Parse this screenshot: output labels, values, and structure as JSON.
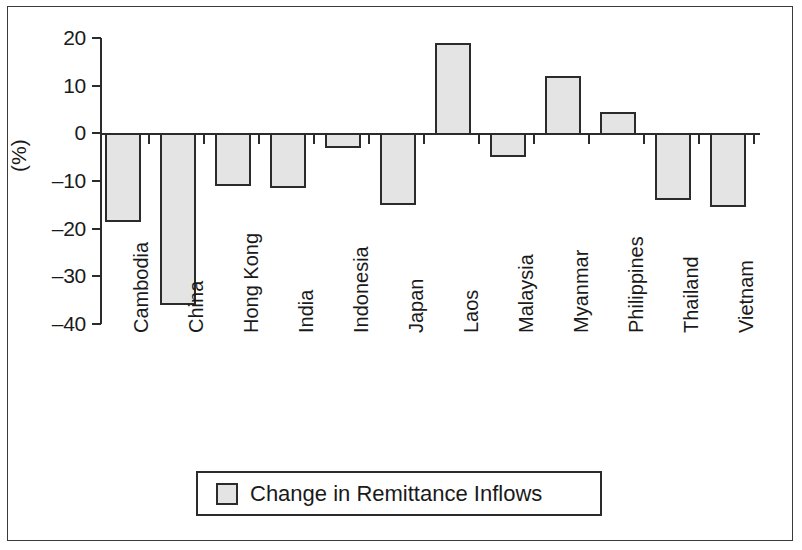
{
  "chart_data": {
    "type": "bar",
    "title": "",
    "xlabel": "",
    "ylabel": "(%)",
    "ylim": [
      -40,
      20
    ],
    "yticks": [
      20,
      10,
      0,
      -10,
      -20,
      -30,
      -40
    ],
    "ytick_labels": [
      "20",
      "10",
      "0",
      "–10",
      "–20",
      "–30",
      "–40"
    ],
    "grid": false,
    "legend_position": "bottom-center",
    "categories": [
      "Cambodia",
      "China",
      "Hong Kong",
      "India",
      "Indonesia",
      "Japan",
      "Laos",
      "Malaysia",
      "Myanmar",
      "Philippines",
      "Thailand",
      "Vietnam"
    ],
    "series": [
      {
        "name": "Change in Remittance Inflows",
        "values": [
          -18.5,
          -36.0,
          -11.0,
          -11.5,
          -3.0,
          -15.0,
          19.0,
          -5.0,
          12.0,
          4.5,
          -14.0,
          -15.5
        ]
      }
    ]
  },
  "legend": {
    "items": [
      {
        "label": "Change in Remittance Inflows",
        "swatch_color": "#e4e4e4"
      }
    ]
  },
  "style": {
    "bar_fill": "#e4e4e4",
    "bar_stroke": "#2b2b2b",
    "axis_color": "#2b2b2b",
    "text_color": "#1a1a1a",
    "background": "#ffffff"
  }
}
